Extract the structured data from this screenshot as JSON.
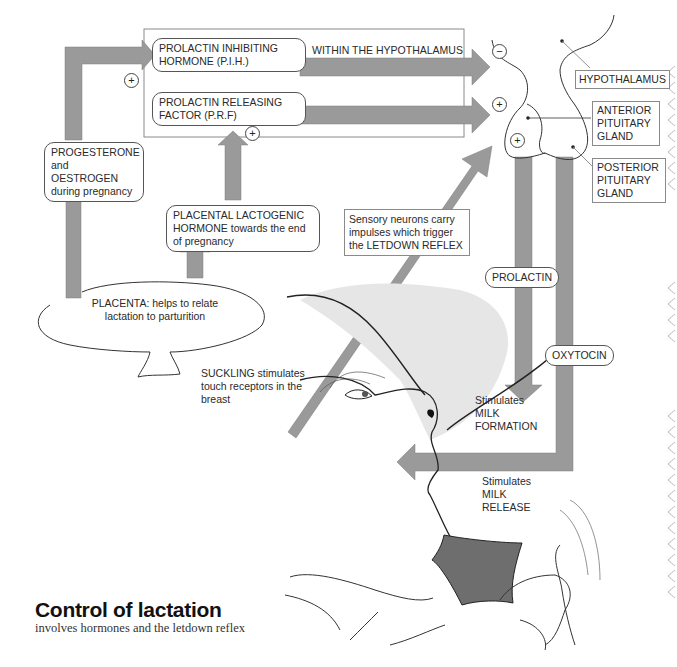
{
  "title": "Control of lactation",
  "subtitle": "involves hormones and the letdown reflex",
  "colors": {
    "arrow": "#9a9a9a",
    "arrow_edge": "#7d7d7d",
    "line": "#333333",
    "box_border": "#8a8a8a",
    "neck_shade": "#7a7a7a"
  },
  "labels": {
    "pih": "PROLACTIN INHIBITING HORMONE (P.I.H.)",
    "prf": "PROLACTIN RELEASING FACTOR (P.R.F)",
    "within_hypothalamus": "WITHIN THE HYPOTHALAMUS",
    "progesterone": "PROGESTERONE and OESTROGEN during pregnancy",
    "placental_lactogenic": "PLACENTAL LACTOGENIC HORMONE towards the end of pregnancy",
    "placenta": "PLACENTA: helps to relate lactation to parturition",
    "sensory": "Sensory neurons carry impulses which trigger the LETDOWN REFLEX",
    "suckling": "SUCKLING stimulates touch receptors in the breast",
    "hypothalamus": "HYPOTHALAMUS",
    "anterior_pituitary": "ANTERIOR PITUITARY GLAND",
    "posterior_pituitary": "POSTERIOR PITUITARY GLAND",
    "prolactin": "PROLACTIN",
    "oxytocin": "OXYTOCIN",
    "milk_formation": "Stimulates MILK FORMATION",
    "milk_release": "Stimulates MILK RELEASE"
  },
  "signs": {
    "plus": "+",
    "minus": "−"
  }
}
